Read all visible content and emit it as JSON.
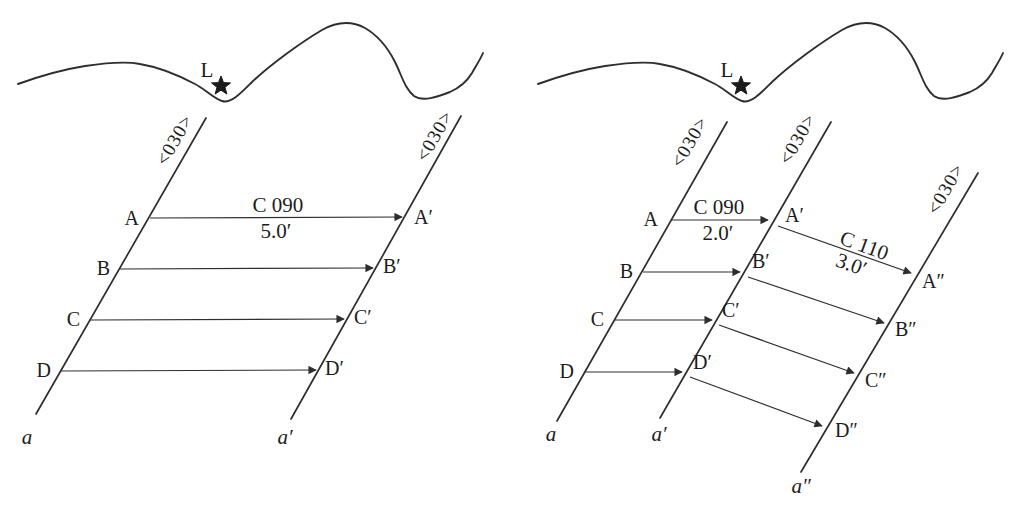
{
  "colors": {
    "ink": "#2e2e2e",
    "text": "#1c1c1c",
    "background": "#ffffff"
  },
  "landmark": {
    "label": "L"
  },
  "track_heading_label": "<030>",
  "left_panel": {
    "leg": {
      "course": "C 090",
      "distance": "5.0′"
    },
    "start_points": [
      "A",
      "B",
      "C",
      "D"
    ],
    "arrival_points": [
      "A′",
      "B′",
      "C′",
      "D′"
    ],
    "track_names": [
      "a",
      "a′"
    ]
  },
  "right_panel": {
    "leg1": {
      "course": "C 090",
      "distance": "2.0′"
    },
    "leg2": {
      "course": "C 110",
      "distance": "3.0′"
    },
    "start_points": [
      "A",
      "B",
      "C",
      "D"
    ],
    "first_arrival_points": [
      "A′",
      "B′",
      "C′",
      "D′"
    ],
    "second_arrival_points": [
      "A″",
      "B″",
      "C″",
      "D″"
    ],
    "track_names": [
      "a",
      "a′",
      "a″"
    ]
  }
}
